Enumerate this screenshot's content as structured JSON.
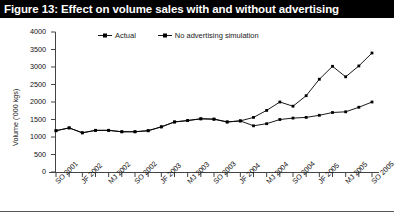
{
  "figure": {
    "title": "Figure 13: Effect on volume sales with and without advertising",
    "title_bar_color": "#000000",
    "title_text_color": "#ffffff"
  },
  "legend": {
    "position": "top-center",
    "entries": [
      {
        "label": "Actual",
        "marker": "line-square-marker",
        "color": "#000000"
      },
      {
        "label": "No advertising simulation",
        "marker": "line-square-marker",
        "color": "#000000"
      }
    ]
  },
  "chart_data": {
    "type": "line",
    "title": "Effect on volume sales with and without advertising",
    "xlabel": "",
    "ylabel": "Volume ('000 kgs)",
    "ylim": [
      0,
      4000
    ],
    "yticks": [
      0,
      500,
      1000,
      1500,
      2000,
      2500,
      3000,
      3500,
      4000
    ],
    "ytick_labels": [
      "0",
      "500",
      "1000",
      "1500",
      "2000",
      "2500",
      "3000",
      "3500",
      "4000"
    ],
    "grid": false,
    "legend_position": "top-center",
    "x": [
      "SO 2001",
      "ND 2001",
      "JF 2002",
      "MA 2002",
      "MJ 2002",
      "JA 2002",
      "SO 2002",
      "ND 2002",
      "JF 2003",
      "MA 2003",
      "MJ 2003",
      "JA 2003",
      "SO 2003",
      "ND 2003",
      "JF 2004",
      "MA 2004",
      "MJ 2004",
      "JA 2004",
      "SO 2004",
      "ND 2004",
      "JF 2005",
      "MA 2005",
      "MJ 2005",
      "JA 2005",
      "SO 2005"
    ],
    "xtick_labels": [
      "SO 2001",
      "JF 2002",
      "MJ 2002",
      "SO 2002",
      "JF 2003",
      "MJ 2003",
      "SO 2003",
      "JF 2004",
      "MJ 2004",
      "SO 2004",
      "JF 2005",
      "MJ 2005",
      "SO 2005"
    ],
    "xtick_label_step": 2,
    "series": [
      {
        "name": "Actual",
        "values": [
          1180,
          1260,
          1120,
          1190,
          1190,
          1150,
          1150,
          1180,
          1290,
          1430,
          1470,
          1520,
          1510,
          1430,
          1460,
          1320,
          1380,
          1500,
          1540,
          1560,
          1620,
          1700,
          1720,
          1850,
          2000
        ]
      },
      {
        "name": "No advertising simulation",
        "values": [
          1180,
          1260,
          1120,
          1190,
          1190,
          1150,
          1150,
          1180,
          1290,
          1430,
          1470,
          1520,
          1510,
          1430,
          1460,
          1560,
          1760,
          2000,
          1880,
          2180,
          2650,
          3020,
          2720,
          3030,
          3400
        ]
      }
    ]
  }
}
